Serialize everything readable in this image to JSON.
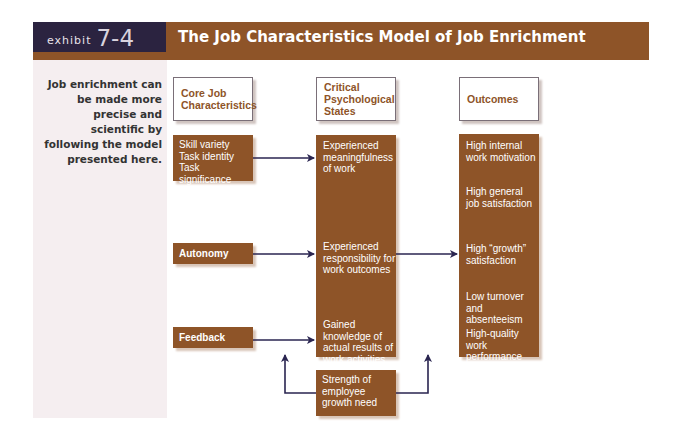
{
  "header": {
    "exhibit_word": "exhibit",
    "exhibit_number": "7-4",
    "title": "The Job Characteristics Model of Job Enrichment"
  },
  "sidebar": {
    "caption": "Job enrichment can be made more precise and scientific by following the model presented here."
  },
  "columns": {
    "core": {
      "header": "Core Job Characteristics"
    },
    "critical": {
      "header": "Critical Psychological States"
    },
    "outcomes": {
      "header": "Outcomes"
    }
  },
  "core_items": [
    "Skill variety\nTask identity\nTask significance",
    "Autonomy",
    "Feedback"
  ],
  "critical_items": [
    "Experienced meaningfulness of work",
    "Experienced responsibility for work outcomes",
    "Gained knowledge of actual results of work activities"
  ],
  "outcome_items": [
    "High internal work motivation",
    "High general job satisfaction",
    "High “growth” satisfaction",
    "Low turnover and absenteeism",
    "High-quality work performance"
  ],
  "moderator": {
    "label": "Strength of employee growth need"
  },
  "colors": {
    "brown": "#8e5428",
    "navy": "#2b2340",
    "arrow": "#2a2550",
    "panel": "#f5eef0"
  }
}
